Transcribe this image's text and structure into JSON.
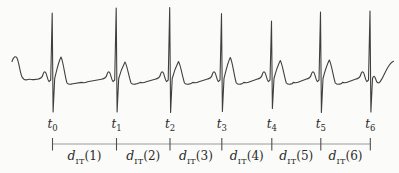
{
  "figure": {
    "background": "#fbfbf9",
    "waveform_color": "#3f3f3f",
    "axis_color": "#9a9a9a",
    "tick_color": "#4f4f4f",
    "text_color": "#2a2a2a"
  },
  "timeline": {
    "axis_y": 144,
    "ticks": [
      {
        "base": "t",
        "sub": "0",
        "x": 52.5
      },
      {
        "base": "t",
        "sub": "1",
        "x": 116.5
      },
      {
        "base": "t",
        "sub": "2",
        "x": 170
      },
      {
        "base": "t",
        "sub": "3",
        "x": 221.8
      },
      {
        "base": "t",
        "sub": "4",
        "x": 271.8
      },
      {
        "base": "t",
        "sub": "5",
        "x": 320.8
      },
      {
        "base": "t",
        "sub": "6",
        "x": 370.3
      }
    ],
    "intervals": [
      {
        "base": "d",
        "sub": "IT",
        "arg": "(1)"
      },
      {
        "base": "d",
        "sub": "IT",
        "arg": "(2)"
      },
      {
        "base": "d",
        "sub": "IT",
        "arg": "(3)"
      },
      {
        "base": "d",
        "sub": "IT",
        "arg": "(4)"
      },
      {
        "base": "d",
        "sub": "IT",
        "arg": "(5)"
      },
      {
        "base": "d",
        "sub": "IT",
        "arg": "(6)"
      }
    ]
  },
  "waveform": {
    "beats": [
      {
        "x": 52.5,
        "top": 13,
        "bottom": 112,
        "t_peak": 57
      },
      {
        "x": 116.5,
        "top": 8,
        "bottom": 112,
        "t_peak": 62
      },
      {
        "x": 170,
        "top": 7.5,
        "bottom": 112.5,
        "t_peak": 61.5
      },
      {
        "x": 221.8,
        "top": 13.5,
        "bottom": 111.5,
        "t_peak": 57.5
      },
      {
        "x": 271.8,
        "top": 21,
        "bottom": 108.5,
        "t_peak": 60.5
      },
      {
        "x": 320.8,
        "top": 12,
        "bottom": 112.5,
        "t_peak": 60
      },
      {
        "x": 370.3,
        "top": 11,
        "bottom": 112,
        "t_peak": 60
      }
    ]
  }
}
